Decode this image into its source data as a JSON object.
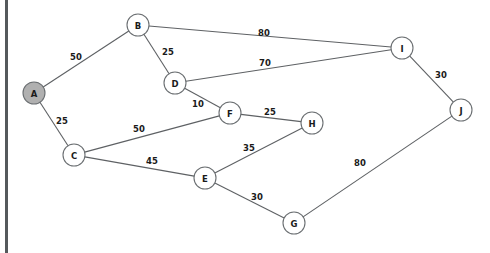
{
  "diagram": {
    "canvas": {
      "width": 490,
      "height": 253
    },
    "colors": {
      "background": "#ffffff",
      "edge": "#5e6164",
      "node_stroke": "#6b6f72",
      "node_fill": "#ffffff",
      "node_fill_highlight": "#b0b0b0",
      "text": "#1a1a1a",
      "left_rule": "#55595c"
    },
    "node_radius": 11,
    "nodes": [
      {
        "id": "A",
        "label": "A",
        "x": 34,
        "y": 93,
        "highlighted": true
      },
      {
        "id": "B",
        "label": "B",
        "x": 138,
        "y": 25,
        "highlighted": false
      },
      {
        "id": "C",
        "label": "C",
        "x": 74,
        "y": 155,
        "highlighted": false
      },
      {
        "id": "D",
        "label": "D",
        "x": 175,
        "y": 83,
        "highlighted": false
      },
      {
        "id": "E",
        "label": "E",
        "x": 205,
        "y": 178,
        "highlighted": false
      },
      {
        "id": "F",
        "label": "F",
        "x": 230,
        "y": 113,
        "highlighted": false
      },
      {
        "id": "G",
        "label": "G",
        "x": 294,
        "y": 223,
        "highlighted": false
      },
      {
        "id": "H",
        "label": "H",
        "x": 312,
        "y": 123,
        "highlighted": false
      },
      {
        "id": "I",
        "label": "I",
        "x": 402,
        "y": 48,
        "highlighted": false
      },
      {
        "id": "J",
        "label": "J",
        "x": 461,
        "y": 110,
        "highlighted": false
      }
    ],
    "edges": [
      {
        "from": "A",
        "to": "B",
        "weight": "50",
        "label_x": 76,
        "label_y": 57
      },
      {
        "from": "A",
        "to": "C",
        "weight": "25",
        "label_x": 62,
        "label_y": 121
      },
      {
        "from": "B",
        "to": "D",
        "weight": "25",
        "label_x": 168,
        "label_y": 52
      },
      {
        "from": "B",
        "to": "I",
        "weight": "80",
        "label_x": 264,
        "label_y": 33
      },
      {
        "from": "D",
        "to": "I",
        "weight": "70",
        "label_x": 265,
        "label_y": 63
      },
      {
        "from": "D",
        "to": "F",
        "weight": "10",
        "label_x": 198,
        "label_y": 104
      },
      {
        "from": "C",
        "to": "F",
        "weight": "50",
        "label_x": 139,
        "label_y": 129
      },
      {
        "from": "C",
        "to": "E",
        "weight": "45",
        "label_x": 152,
        "label_y": 161
      },
      {
        "from": "F",
        "to": "H",
        "weight": "25",
        "label_x": 270,
        "label_y": 112
      },
      {
        "from": "E",
        "to": "H",
        "weight": "35",
        "label_x": 249,
        "label_y": 148
      },
      {
        "from": "E",
        "to": "G",
        "weight": "30",
        "label_x": 257,
        "label_y": 197
      },
      {
        "from": "G",
        "to": "J",
        "weight": "80",
        "label_x": 360,
        "label_y": 163
      },
      {
        "from": "I",
        "to": "J",
        "weight": "30",
        "label_x": 441,
        "label_y": 75
      }
    ]
  }
}
